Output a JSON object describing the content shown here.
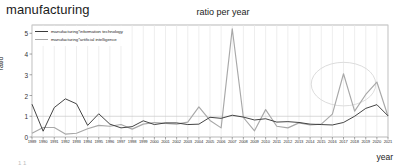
{
  "page": {
    "heading": "manufacturing",
    "bottom_fragment": "1 1"
  },
  "chart_data": {
    "type": "line",
    "title": "ratio per year",
    "xlabel": "year",
    "ylabel": "ratio",
    "grid": true,
    "grid_axis": "x",
    "legend_position": "upper-left",
    "xlim": [
      1989,
      2021
    ],
    "ylim": [
      0,
      5.4
    ],
    "yticks": [
      0,
      1,
      2,
      3,
      4,
      5
    ],
    "categories": [
      "1989",
      "1990",
      "1991",
      "1992",
      "1993",
      "1994",
      "1995",
      "1996",
      "1997",
      "1998",
      "1999",
      "2000",
      "2001",
      "2002",
      "2003",
      "2004",
      "2005",
      "2006",
      "2007",
      "2008",
      "2009",
      "2010",
      "2011",
      "2012",
      "2013",
      "2014",
      "2015",
      "2016",
      "2017",
      "2018",
      "2019",
      "2020",
      "2021"
    ],
    "series": [
      {
        "name": "manufacturing*information technology",
        "color": "#3a3a3a",
        "values": [
          1.58,
          0.28,
          1.42,
          1.84,
          1.6,
          0.56,
          1.12,
          0.62,
          0.44,
          0.5,
          0.78,
          0.6,
          0.68,
          0.68,
          0.6,
          0.62,
          0.95,
          0.9,
          1.05,
          0.96,
          0.82,
          0.88,
          0.72,
          0.74,
          0.7,
          0.62,
          0.6,
          0.58,
          0.7,
          1.0,
          1.38,
          1.56,
          1.02
        ]
      },
      {
        "name": "manufacturing*artificial intelligence",
        "color": "#a8a8a8",
        "values": [
          0.18,
          0.46,
          0.46,
          0.14,
          0.18,
          0.4,
          0.56,
          0.52,
          0.6,
          0.38,
          0.62,
          0.7,
          0.66,
          0.62,
          0.72,
          1.45,
          0.8,
          0.44,
          5.22,
          0.94,
          0.3,
          1.32,
          0.52,
          0.44,
          0.68,
          0.58,
          0.62,
          1.1,
          3.05,
          1.25,
          2.05,
          2.65,
          1.0
        ]
      }
    ],
    "reference_line": {
      "y": 1.0,
      "color": "#c9c9c9"
    },
    "annotations": [
      {
        "type": "ellipse",
        "label": "highlight-ellipse",
        "color": "#d8d8d8",
        "x_center": 2017.0,
        "x_radius": 2.9,
        "y_center": 2.55,
        "y_radius": 1.05
      }
    ]
  }
}
